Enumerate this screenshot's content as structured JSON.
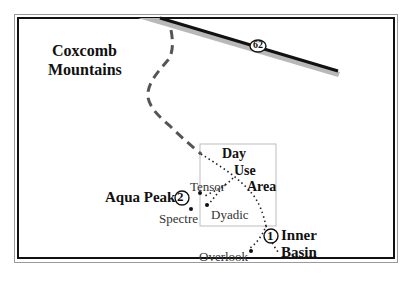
{
  "map": {
    "region_labels": {
      "mountains_line1": "Coxcomb",
      "mountains_line2": "Mountains"
    },
    "highway": {
      "route_number": "62"
    },
    "day_use_area": {
      "line1": "Day",
      "line2": "Use",
      "line3": "Area"
    },
    "points": {
      "aqua_peak": {
        "label": "Aqua Peak",
        "marker": "2"
      },
      "inner_basin": {
        "label_line1": "Inner",
        "label_line2": "Basin",
        "marker": "1"
      },
      "tensor": {
        "label": "Tensor"
      },
      "dyadic": {
        "label": "Dyadic"
      },
      "spectre": {
        "label": "Spectre"
      },
      "overlook": {
        "label": "Overlook"
      }
    },
    "colors": {
      "frame": "#111111",
      "road": "#111111",
      "road_shadow": "#b8b8b8",
      "trail_dashed": "#555555",
      "trail_dotted": "#222222",
      "area_box": "#bdbdbd"
    }
  }
}
